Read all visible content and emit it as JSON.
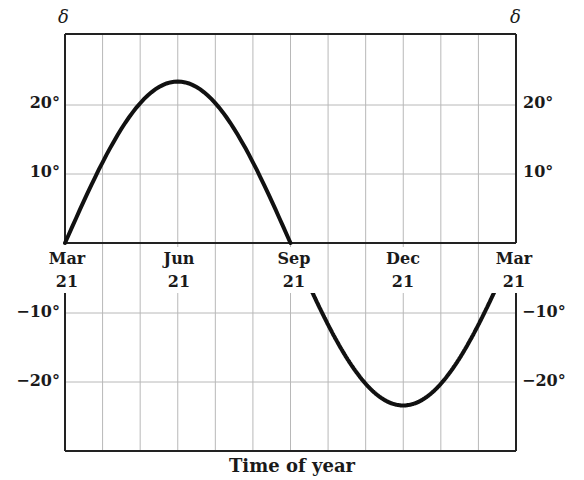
{
  "chart_data": {
    "type": "line",
    "title": "",
    "xlabel": "Time of year",
    "ylabel": "δ",
    "y_axis_symbol_left": "δ",
    "y_axis_symbol_right": "δ",
    "x_ticks": [
      {
        "month": "Mar",
        "day": "21"
      },
      {
        "month": "Jun",
        "day": "21"
      },
      {
        "month": "Sep",
        "day": "21"
      },
      {
        "month": "Dec",
        "day": "21"
      },
      {
        "month": "Mar",
        "day": "21"
      }
    ],
    "y_ticks_upper": [
      "20°",
      "10°"
    ],
    "y_ticks_lower": [
      "−10°",
      "−20°"
    ],
    "ylim": [
      -30,
      30
    ],
    "grid": true,
    "grid_x_divisions": 12,
    "series": [
      {
        "name": "Solar declination",
        "x": [
          "Mar 21",
          "Apr 21",
          "May 21",
          "Jun 21",
          "Jul 21",
          "Aug 21",
          "Sep 21",
          "Oct 21",
          "Nov 21",
          "Dec 21",
          "Jan 21",
          "Feb 21",
          "Mar 21"
        ],
        "values": [
          0,
          11.7,
          20.3,
          23.4,
          20.3,
          11.7,
          0,
          -11.7,
          -20.3,
          -23.4,
          -20.3,
          -11.7,
          0
        ]
      }
    ]
  }
}
